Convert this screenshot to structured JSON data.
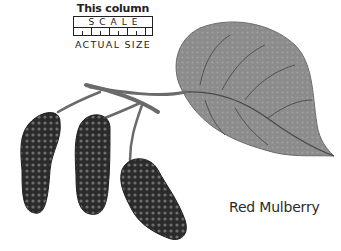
{
  "scale": {
    "caption": "This column",
    "word": "SCALE",
    "subcaption": "ACTUAL SIZE"
  },
  "species": {
    "name": "Red Mulberry"
  },
  "illustration": {
    "subject": "mulberry branch with leaf and three fruits",
    "colors": {
      "leaf": "#8a8a8a",
      "leaf_vein": "#4a4a4a",
      "fruit": "#2b2b2b",
      "fruit_highlight": "#7a7a7a",
      "stem": "#6a6a6a"
    }
  }
}
